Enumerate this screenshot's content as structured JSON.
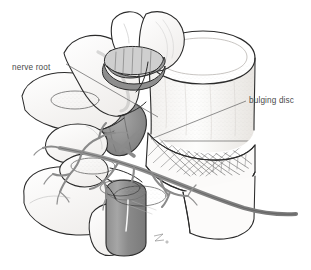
{
  "illustration": {
    "title": "Lumbar vertebra with bulging disc",
    "view": "oblique posterolateral",
    "background_color": "#ffffff",
    "ink_color": "#2b2b2b",
    "label_color": "#4a4a4a",
    "leader_color": "#6b6b6b",
    "shade_gray": "#8d8d8d",
    "shade_gray_dark": "#777777",
    "shade_gray_light": "#b9b9b9",
    "fiber_color": "#555555",
    "stipple_color": "#9a9a9a"
  },
  "labels": [
    {
      "id": "nerve-root",
      "text": "nerve root",
      "text_x": 12,
      "text_y": 70,
      "leader": "M 66,64 L 158,117",
      "anchor": "start"
    },
    {
      "id": "bulging-disc",
      "text": "bulging disc",
      "text_x": 249,
      "text_y": 103,
      "leader": "M 246,101 L 151,139",
      "anchor": "start"
    }
  ],
  "structures": [
    {
      "id": "vertebral-body",
      "name": "vertebral body"
    },
    {
      "id": "bulging-disc-mass",
      "name": "bulging intervertebral disc"
    },
    {
      "id": "annulus-fibrosus-fibers",
      "name": "annulus fibrosus fibers"
    },
    {
      "id": "thecal-sac",
      "name": "thecal sac / spinal cord"
    },
    {
      "id": "herniation-bulge",
      "name": "posterolateral disc herniation"
    },
    {
      "id": "nerve-root-trunk",
      "name": "exiting nerve root"
    },
    {
      "id": "nerve-root-branches",
      "name": "nerve root branches"
    },
    {
      "id": "superior-articular-process",
      "name": "superior articular process"
    },
    {
      "id": "facet-joint",
      "name": "facet joint cartilage"
    },
    {
      "id": "transverse-process-upper",
      "name": "upper transverse process"
    },
    {
      "id": "transverse-process-lower",
      "name": "lower transverse process"
    },
    {
      "id": "lamina",
      "name": "lamina"
    },
    {
      "id": "pedicle",
      "name": "pedicle"
    },
    {
      "id": "spinous-process",
      "name": "spinous process"
    },
    {
      "id": "artist-mark",
      "name": "artist signature mark"
    }
  ],
  "artist_mark": {
    "x": 158,
    "y": 238,
    "text": ""
  }
}
